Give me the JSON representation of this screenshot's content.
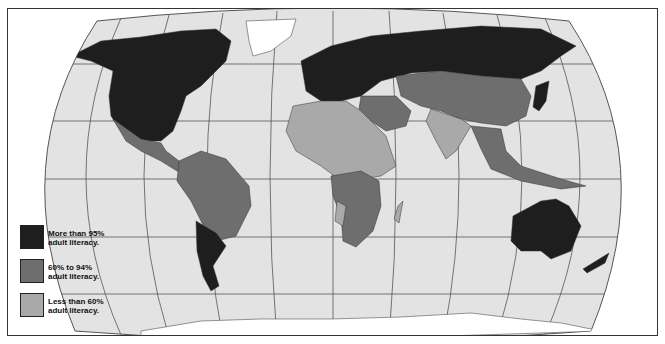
{
  "map": {
    "title": "World adult literacy",
    "projection": "Robinson",
    "colors": {
      "ocean": "#e3e3e3",
      "graticule": "#555555",
      "high": "#1e1e1e",
      "medium": "#6e6e6e",
      "low": "#a9a9a9",
      "nodata": "#ffffff",
      "border": "#333333"
    }
  },
  "legend": {
    "items": [
      {
        "line1": "More than 95%",
        "line2": "adult literacy.",
        "color": "#1e1e1e",
        "category": "high"
      },
      {
        "line1": "60% to 94%",
        "line2": "adult literacy.",
        "color": "#6e6e6e",
        "category": "medium"
      },
      {
        "line1": "Less than 60%",
        "line2": "adult literacy.",
        "color": "#a9a9a9",
        "category": "low"
      }
    ]
  },
  "regions": [
    {
      "name": "North America (USA, Canada)",
      "category": "high"
    },
    {
      "name": "Greenland",
      "category": "nodata"
    },
    {
      "name": "Mexico & Central America",
      "category": "medium"
    },
    {
      "name": "South America (most)",
      "category": "medium"
    },
    {
      "name": "Argentina / Chile / Uruguay",
      "category": "high"
    },
    {
      "name": "Europe & Russia",
      "category": "high"
    },
    {
      "name": "North Africa",
      "category": "low"
    },
    {
      "name": "Sub-Saharan Africa (most)",
      "category": "low"
    },
    {
      "name": "Central & Southern Africa (some)",
      "category": "medium"
    },
    {
      "name": "Middle East",
      "category": "medium"
    },
    {
      "name": "Central Asia",
      "category": "medium"
    },
    {
      "name": "China",
      "category": "medium"
    },
    {
      "name": "India & South Asia",
      "category": "low"
    },
    {
      "name": "Southeast Asia",
      "category": "medium"
    },
    {
      "name": "Japan & Korea",
      "category": "high"
    },
    {
      "name": "Australia & New Zealand",
      "category": "high"
    },
    {
      "name": "Antarctica",
      "category": "nodata"
    }
  ]
}
